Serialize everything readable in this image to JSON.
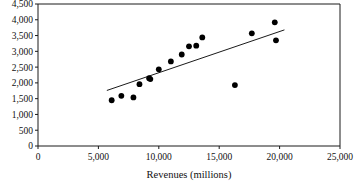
{
  "chart_data": {
    "type": "scatter",
    "title": "",
    "xlabel": "Revenues (millions)",
    "ylabel": "",
    "xlim": [
      0,
      25000
    ],
    "ylim": [
      0,
      4500
    ],
    "grid": false,
    "legend": null,
    "xticks": [
      0,
      5000,
      10000,
      15000,
      20000,
      25000
    ],
    "xticklabels": [
      "0",
      "5,000",
      "10,000",
      "15,000",
      "20,000",
      "25,000"
    ],
    "yticks": [
      0,
      500,
      1000,
      1500,
      2000,
      2500,
      3000,
      3500,
      4000,
      4500
    ],
    "yticklabels": [
      "0",
      "500",
      "1,000",
      "1,500",
      "2,000",
      "2,500",
      "3,000",
      "3,500",
      "4,000",
      "4,500"
    ],
    "marker": "filled-circle",
    "marker_color": "#000000",
    "points": [
      {
        "x": 6100,
        "y": 1450
      },
      {
        "x": 6900,
        "y": 1590
      },
      {
        "x": 7900,
        "y": 1540
      },
      {
        "x": 8400,
        "y": 1960
      },
      {
        "x": 9200,
        "y": 2150
      },
      {
        "x": 9300,
        "y": 2120
      },
      {
        "x": 10000,
        "y": 2430
      },
      {
        "x": 11000,
        "y": 2680
      },
      {
        "x": 11900,
        "y": 2900
      },
      {
        "x": 12500,
        "y": 3160
      },
      {
        "x": 13100,
        "y": 3180
      },
      {
        "x": 13600,
        "y": 3440
      },
      {
        "x": 16300,
        "y": 1930
      },
      {
        "x": 17700,
        "y": 3570
      },
      {
        "x": 19600,
        "y": 3920
      },
      {
        "x": 19700,
        "y": 3350
      }
    ],
    "trend_line": {
      "type": "linear-fit",
      "x_start": 5700,
      "y_start": 1760,
      "x_end": 20400,
      "y_end": 3680
    }
  }
}
